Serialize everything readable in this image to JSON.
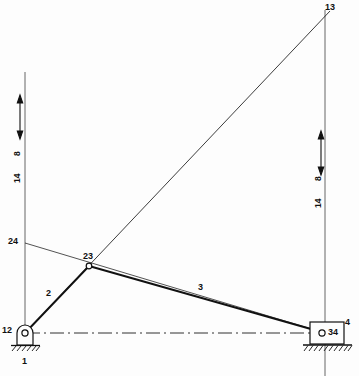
{
  "figure": {
    "kind": "kinematic-linkage-diagram",
    "background_color": "#fdfdfd",
    "line_color": "#1a1a1a"
  },
  "joints": [
    {
      "id": "12",
      "label": "12",
      "x": 25,
      "y": 333,
      "type": "pin-support"
    },
    {
      "id": "23",
      "label": "23",
      "x": 89,
      "y": 266,
      "type": "revolute-joint"
    },
    {
      "id": "34",
      "label": "34",
      "x": 325,
      "y": 333,
      "type": "slider-pin"
    }
  ],
  "instant_centers": [
    {
      "id": "13",
      "label": "13",
      "x": 330,
      "y": 10
    },
    {
      "id": "24",
      "label": "24",
      "x": 18,
      "y": 243
    }
  ],
  "links": [
    {
      "id": "1",
      "label": "1",
      "x": 30,
      "y": 362,
      "note": "ground/frame"
    },
    {
      "id": "2",
      "label": "2",
      "x": 48,
      "y": 294,
      "note": "crank"
    },
    {
      "id": "3",
      "label": "3",
      "x": 200,
      "y": 288,
      "note": "coupler"
    },
    {
      "id": "4",
      "label": "4",
      "x": 345,
      "y": 325,
      "note": "slider"
    }
  ],
  "dimensions": [
    {
      "id": "left-velocity-scale",
      "upper_label": "8",
      "lower_label": "14",
      "upper_x": 16,
      "upper_y": 160,
      "lower_x": 16,
      "lower_y": 190,
      "arrow_x": 20,
      "arrow_top": 97,
      "arrow_bottom": 137
    },
    {
      "id": "right-velocity-scale",
      "upper_label": "8",
      "lower_label": "14",
      "upper_x": 316,
      "upper_y": 185,
      "lower_x": 316,
      "lower_y": 215,
      "arrow_x": 321,
      "arrow_top": 133,
      "arrow_bottom": 173
    }
  ],
  "construction_lines": {
    "left_vertical": {
      "x": 25,
      "y1": 72,
      "y2": 333
    },
    "right_vertical": {
      "x": 325,
      "y1": 10,
      "y2": 376
    },
    "centerline": {
      "x1": 25,
      "y1": 333,
      "x2": 325,
      "y2": 333
    },
    "ic_line_24_13": {
      "x1": 25,
      "y1": 243,
      "x2": 325,
      "y2": 333
    },
    "ic_line_13": {
      "x1": 25,
      "y1": 333,
      "x2": 330,
      "y2": 10
    }
  }
}
